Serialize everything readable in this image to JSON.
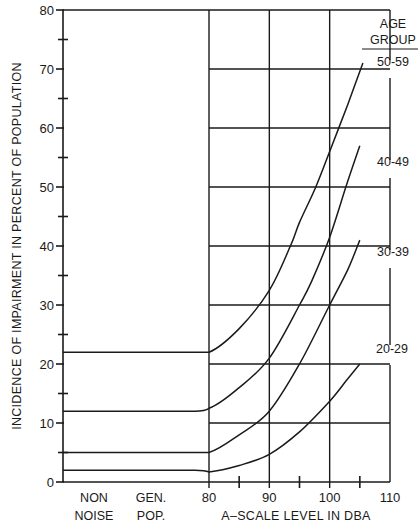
{
  "chart_data": {
    "type": "line",
    "title": "",
    "xlabel": "A-SCALE LEVEL IN DBA",
    "ylabel": "INCIDENCE OF IMPAIRMENT IN PERCENT OF POPULATION",
    "ylim": [
      0,
      80
    ],
    "xlim": [
      80,
      110
    ],
    "grid": true,
    "y_ticks": [
      0,
      10,
      20,
      30,
      40,
      50,
      60,
      70,
      80
    ],
    "y_minor_ticks": [
      5,
      15,
      25,
      35,
      45,
      55,
      65,
      75
    ],
    "x_ticks": [
      80,
      90,
      100,
      110
    ],
    "x_minor_ticks": [
      85,
      95,
      105
    ],
    "x_categories_left": [
      "NON NOISE",
      "GEN. POP."
    ],
    "legend_title": "AGE GROUP",
    "legend_position": "right, labels at curve ends",
    "series": [
      {
        "name": "50-59",
        "baseline_non_noise": 22,
        "points": [
          [
            80,
            22
          ],
          [
            85,
            26
          ],
          [
            90,
            32.5
          ],
          [
            93.5,
            40
          ],
          [
            95,
            44
          ],
          [
            97.7,
            50
          ],
          [
            100,
            56
          ],
          [
            103,
            64
          ],
          [
            105.5,
            71
          ]
        ]
      },
      {
        "name": "40-49",
        "baseline_non_noise": 12,
        "points": [
          [
            80,
            12.5
          ],
          [
            85,
            16
          ],
          [
            90,
            21
          ],
          [
            95,
            30
          ],
          [
            97,
            34
          ],
          [
            100,
            41.5
          ],
          [
            103,
            51
          ],
          [
            105,
            57
          ]
        ]
      },
      {
        "name": "30-39",
        "baseline_non_noise": 5,
        "points": [
          [
            80,
            5
          ],
          [
            85,
            8
          ],
          [
            90,
            12
          ],
          [
            95,
            20
          ],
          [
            100,
            30
          ],
          [
            103,
            36
          ],
          [
            105,
            41
          ]
        ]
      },
      {
        "name": "20-29",
        "baseline_non_noise": 2,
        "points": [
          [
            80,
            1.7
          ],
          [
            85,
            2.8
          ],
          [
            90,
            4.7
          ],
          [
            95,
            8.5
          ],
          [
            100,
            13.7
          ],
          [
            103,
            17.5
          ],
          [
            105,
            20
          ]
        ]
      }
    ]
  },
  "labels": {
    "y_axis_title": "INCIDENCE OF IMPAIRMENT IN PERCENT OF POPULATION",
    "x_axis_title": "A–SCALE LEVEL IN DBA",
    "legend_title_line1": "AGE",
    "legend_title_line2": "GROUP",
    "cat_non": "NON",
    "cat_noise": "NOISE",
    "cat_gen": "GEN.",
    "cat_pop": "POP."
  }
}
